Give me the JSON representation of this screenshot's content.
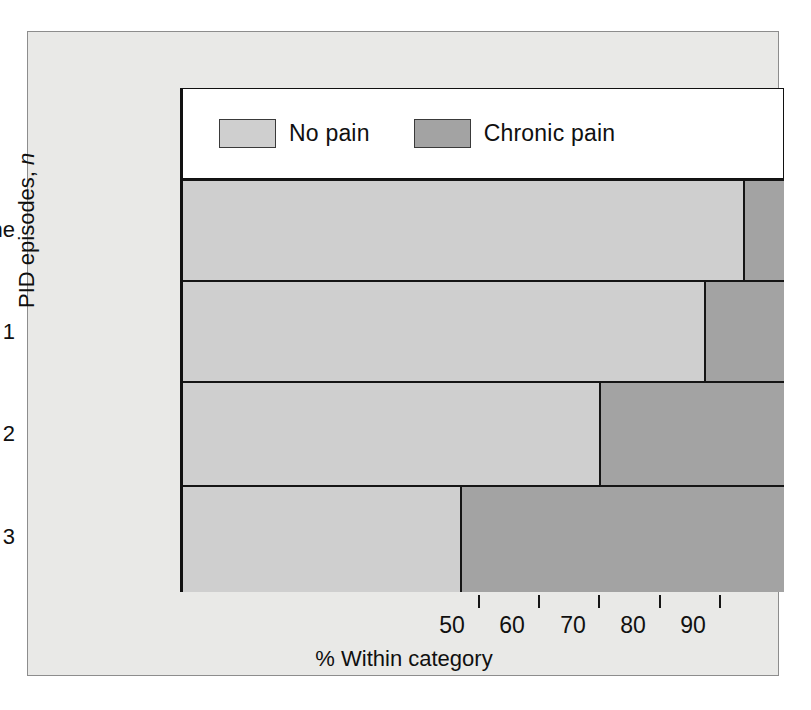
{
  "chart_data": {
    "type": "bar",
    "orientation": "horizontal",
    "stacked": true,
    "stack_total": 100,
    "title": "",
    "xlabel": "% Within category",
    "ylabel": "PID episodes, n",
    "ylabel_parts": {
      "text": "PID episodes, ",
      "italic": "n"
    },
    "categories": [
      "None",
      "1",
      "2",
      "≥ 3"
    ],
    "xlim": [
      0,
      100
    ],
    "xticks": [
      50,
      60,
      70,
      80,
      90
    ],
    "xtick_labels": [
      "50",
      "60",
      "70",
      "80",
      "90"
    ],
    "grid": false,
    "legend_position": "top-left-inside",
    "series": [
      {
        "name": "No pain",
        "color": "#cfcfcf",
        "values": [
          93.5,
          87.0,
          69.5,
          46.5
        ]
      },
      {
        "name": "Chronic pain",
        "color": "#a3a3a3",
        "values": [
          6.5,
          13.0,
          30.5,
          53.5
        ]
      }
    ],
    "legend": [
      {
        "label": "No pain",
        "color": "#cfcfcf"
      },
      {
        "label": "Chronic pain",
        "color": "#a3a3a3"
      }
    ]
  },
  "figure": {
    "background": "#e9e9e7",
    "plot_background": "#ffffff",
    "axis_color": "#111111",
    "border_color": "#8d8d8d"
  }
}
